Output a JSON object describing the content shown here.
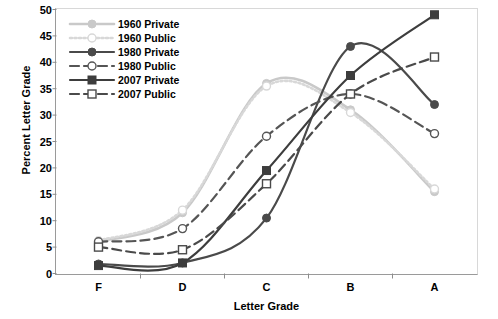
{
  "chart_data": {
    "type": "line",
    "title": "",
    "xlabel": "Letter Grade",
    "ylabel": "Percent Letter Grade",
    "categories": [
      "F",
      "D",
      "C",
      "B",
      "A"
    ],
    "ylim": [
      0,
      50
    ],
    "yticks": [
      0,
      5,
      10,
      15,
      20,
      25,
      30,
      35,
      40,
      45,
      50
    ],
    "grid": false,
    "legend_position": "top-left",
    "series": [
      {
        "name": "1960 Private",
        "values": [
          6.0,
          11.5,
          36.0,
          31.0,
          15.5
        ],
        "color": "#c9c9c9",
        "dash": "solid",
        "marker": "circle-filled"
      },
      {
        "name": "1960 Public",
        "values": [
          6.2,
          12.0,
          35.5,
          30.5,
          16.0
        ],
        "color": "#d8d8d8",
        "dash": "dotted",
        "marker": "circle-open"
      },
      {
        "name": "1980 Private",
        "values": [
          1.8,
          2.0,
          10.5,
          43.0,
          32.0
        ],
        "color": "#4a4a4a",
        "dash": "solid",
        "marker": "circle-filled"
      },
      {
        "name": "1980 Public",
        "values": [
          6.0,
          8.5,
          26.0,
          34.0,
          26.5
        ],
        "color": "#555555",
        "dash": "dashed",
        "marker": "circle-open"
      },
      {
        "name": "2007 Private",
        "values": [
          1.5,
          2.0,
          19.5,
          37.5,
          49.0
        ],
        "color": "#3d3d3d",
        "dash": "solid",
        "marker": "square-filled"
      },
      {
        "name": "2007 Public",
        "values": [
          5.0,
          4.5,
          17.0,
          34.0,
          41.0
        ],
        "color": "#4a4a4a",
        "dash": "dashed",
        "marker": "square-open"
      }
    ]
  }
}
